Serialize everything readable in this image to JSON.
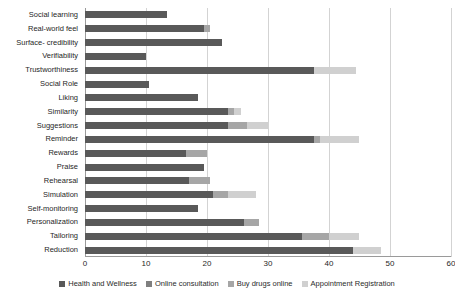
{
  "chart_data": {
    "type": "bar",
    "orientation": "horizontal",
    "stacked": true,
    "title": "",
    "xlabel": "",
    "ylabel": "",
    "xlim": [
      0,
      60
    ],
    "xticks": [
      0,
      10,
      20,
      30,
      40,
      50,
      60
    ],
    "grid": true,
    "legend_position": "bottom",
    "categories": [
      "Social learning",
      "Real-world feel",
      "Surface- credibility",
      "Verifiability",
      "Trustworthiness",
      "Social Role",
      "Liking",
      "Similarity",
      "Suggestions",
      "Reminder",
      "Rewards",
      "Praise",
      "Rehearsal",
      "Simulation",
      "Self-monitoring",
      "Personalization",
      "Tailoring",
      "Reduction"
    ],
    "series": [
      {
        "name": "Health and Wellness",
        "color": "#595959",
        "values": [
          13.5,
          19.5,
          22.5,
          10.0,
          37.5,
          10.5,
          18.5,
          23.5,
          23.5,
          37.5,
          16.5,
          19.5,
          17.0,
          21.0,
          18.5,
          26.0,
          35.5,
          44.0
        ]
      },
      {
        "name": "Online consultation",
        "color": "#7f7f7f",
        "values": [
          0,
          0,
          0,
          0,
          0,
          0,
          0,
          0,
          0,
          0,
          0,
          0,
          0,
          0,
          0,
          0,
          0,
          0
        ]
      },
      {
        "name": "Buy drugs online",
        "color": "#a6a6a6",
        "values": [
          0,
          1.0,
          0,
          0,
          0,
          0,
          0,
          1.0,
          3.0,
          1.0,
          3.5,
          0,
          3.5,
          2.5,
          0,
          2.5,
          4.5,
          0
        ]
      },
      {
        "name": "Appointment Registration",
        "color": "#d0d0d0",
        "values": [
          0,
          0,
          0,
          0,
          7.0,
          0,
          0,
          1.0,
          3.5,
          6.5,
          0,
          0,
          0,
          4.5,
          0,
          0,
          5.0,
          4.5
        ]
      }
    ],
    "totals": [
      13.5,
      20.5,
      22.5,
      10.0,
      44.5,
      10.5,
      18.5,
      25.5,
      30.0,
      45.0,
      20.0,
      19.5,
      20.5,
      28.0,
      18.5,
      28.5,
      45.0,
      48.5
    ]
  },
  "legend": {
    "items": [
      "Health and Wellness",
      "Online consultation",
      "Buy drugs online",
      "Appointment Registration"
    ]
  }
}
